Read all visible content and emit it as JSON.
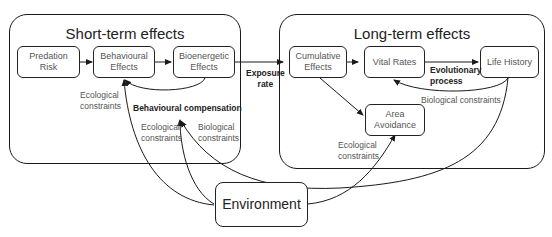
{
  "groups": {
    "short_term": {
      "title": "Short-term effects"
    },
    "long_term": {
      "title": "Long-term effects"
    }
  },
  "nodes": {
    "predation_risk": "Predation\nRisk",
    "behavioural_effects": "Behavioural\nEffects",
    "bioenergetic_effects": "Bioenergetic\nEffects",
    "cumulative_effects": "Cumulative\nEffects",
    "vital_rates": "Vital Rates",
    "life_history": "Life History",
    "area_avoidance": "Area\nAvoidance",
    "environment": "Environment"
  },
  "labels": {
    "exposure_rate": "Exposure\nrate",
    "evolutionary_process": "Evolutionary\nprocess",
    "behavioural_compensation": "Behavioural compensation",
    "ecological_constraints_1": "Ecological\nconstraints",
    "ecological_constraints_2": "Ecological\nconstraints",
    "biological_constraints_1": "Biological\nconstraints",
    "biological_constraints_2": "Biological constraints",
    "ecological_constraints_3": "Ecological\nconstraints"
  },
  "colors": {
    "stroke": "#1a1a1a",
    "node_text": "#555555",
    "title_text": "#222222"
  }
}
